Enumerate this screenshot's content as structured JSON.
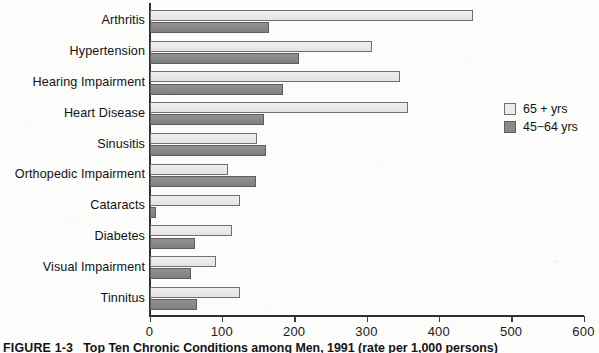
{
  "figure": {
    "caption_number": "FIGURE 1-3",
    "caption_text": "Top Ten Chronic Conditions among Men, 1991 (rate per 1,000 persons)"
  },
  "legend": {
    "position": "right",
    "items": [
      {
        "label": "65 + yrs",
        "color": "#ececec",
        "swatch": "light-swatch"
      },
      {
        "label": "45−64 yrs",
        "color": "#8a8a8a",
        "swatch": "dark-swatch"
      }
    ]
  },
  "axis": {
    "x_ticks": [
      "0",
      "100",
      "200",
      "300",
      "400",
      "500",
      "600"
    ]
  },
  "chart_data": {
    "type": "bar",
    "orientation": "horizontal",
    "title": "",
    "xlabel": "",
    "ylabel": "",
    "xlim": [
      0,
      600
    ],
    "grid": false,
    "legend_position": "right",
    "categories": [
      "Arthritis",
      "Hypertension",
      "Hearing Impairment",
      "Heart Disease",
      "Sinusitis",
      "Orthopedic Impairment",
      "Cataracts",
      "Diabetes",
      "Visual Impairment",
      "Tinnitus"
    ],
    "series": [
      {
        "name": "65 + yrs",
        "color": "#ececec",
        "values": [
          447,
          307,
          345,
          357,
          148,
          108,
          125,
          113,
          91,
          125
        ]
      },
      {
        "name": "45−64 yrs",
        "color": "#8a8a8a",
        "values": [
          165,
          206,
          184,
          157,
          161,
          147,
          8,
          62,
          56,
          65
        ]
      }
    ]
  }
}
